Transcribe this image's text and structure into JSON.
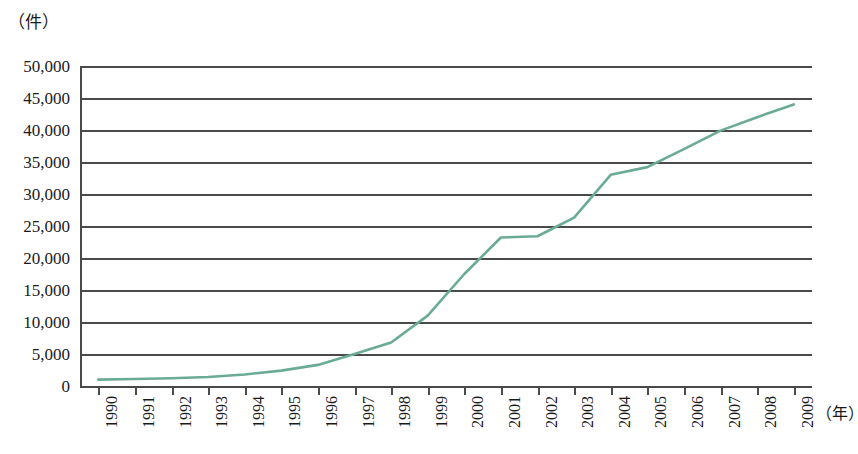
{
  "chart_data": {
    "type": "line",
    "title": "",
    "xlabel": "（年）",
    "ylabel": "（件）",
    "categories": [
      "1990",
      "1991",
      "1992",
      "1993",
      "1994",
      "1995",
      "1996",
      "1997",
      "1998",
      "1999",
      "2000",
      "2001",
      "2002",
      "2003",
      "2004",
      "2005",
      "2006",
      "2007",
      "2008",
      "2009"
    ],
    "values": [
      1000,
      1100,
      1200,
      1400,
      1800,
      2400,
      3300,
      5000,
      6800,
      11000,
      17500,
      23200,
      23400,
      26300,
      33000,
      34200,
      37000,
      39900,
      42000,
      44000
    ],
    "series": [
      {
        "name": "件数",
        "values": [
          1000,
          1100,
          1200,
          1400,
          1800,
          2400,
          3300,
          5000,
          6800,
          11000,
          17500,
          23200,
          23400,
          26300,
          33000,
          34200,
          37000,
          39900,
          42000,
          44000
        ],
        "color": "#6aab93"
      }
    ],
    "ylim": [
      0,
      50000
    ],
    "yticks": [
      0,
      5000,
      10000,
      15000,
      20000,
      25000,
      30000,
      35000,
      40000,
      45000,
      50000
    ],
    "ytick_labels": [
      "0",
      "5,000",
      "10,000",
      "15,000",
      "20,000",
      "25,000",
      "30,000",
      "35,000",
      "40,000",
      "45,000",
      "50,000"
    ],
    "grid": "horizontal",
    "legend": "none",
    "line_color": "#6aab93",
    "grid_color": "#4a4a4a",
    "axis_color": "#4a4a4a"
  },
  "axes": {
    "y_unit_label": "（件）",
    "x_unit_label": "（年）"
  },
  "caption": {
    "text": ""
  }
}
